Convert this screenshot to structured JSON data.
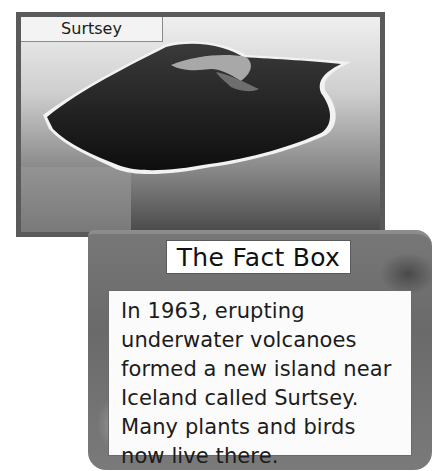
{
  "photo": {
    "label": "Surtsey",
    "image_alt": "Aerial view of Surtsey island"
  },
  "fact_box": {
    "title": "The Fact Box",
    "text": "In 1963, erupting underwater volcanoes formed a new island near Iceland called Surtsey. Many plants and birds now live there."
  },
  "colors": {
    "frame_border": "#5a5a5a",
    "fact_box_bg": "#777777",
    "text_box_bg": "#fbfbfb",
    "text": "#1c1c1c"
  }
}
